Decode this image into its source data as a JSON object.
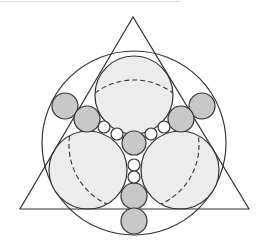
{
  "diagram": {
    "title": "",
    "stroke": "#333333",
    "colors": {
      "large_fill": "#ececec",
      "medium_fill": "#c8c8c8",
      "small_fill": "#ffffff",
      "background": "#ffffff"
    },
    "triangle": {
      "points": [
        [
          133,
          17
        ],
        [
          20,
          209
        ],
        [
          249,
          209
        ]
      ]
    },
    "outer_circle": {
      "cx": 134,
      "cy": 143,
      "r": 92
    },
    "dashed_circle": {
      "cx": 134,
      "cy": 145,
      "r": 65
    },
    "large_circles": [
      {
        "cx": 134,
        "cy": 95,
        "r": 39
      },
      {
        "cx": 88,
        "cy": 170,
        "r": 39
      },
      {
        "cx": 180,
        "cy": 170,
        "r": 39
      }
    ],
    "medium_circles": [
      {
        "cx": 134,
        "cy": 143,
        "r": 12
      },
      {
        "cx": 65,
        "cy": 106,
        "r": 13
      },
      {
        "cx": 87,
        "cy": 119,
        "r": 13
      },
      {
        "cx": 202,
        "cy": 106,
        "r": 13
      },
      {
        "cx": 181,
        "cy": 119,
        "r": 13
      },
      {
        "cx": 134,
        "cy": 196,
        "r": 13
      },
      {
        "cx": 134,
        "cy": 221,
        "r": 13
      }
    ],
    "small_circles": [
      {
        "cx": 104,
        "cy": 127,
        "r": 6
      },
      {
        "cx": 117,
        "cy": 134,
        "r": 6
      },
      {
        "cx": 164,
        "cy": 127,
        "r": 6
      },
      {
        "cx": 151,
        "cy": 134,
        "r": 6
      },
      {
        "cx": 134,
        "cy": 165,
        "r": 6
      },
      {
        "cx": 134,
        "cy": 177,
        "r": 6
      }
    ]
  }
}
